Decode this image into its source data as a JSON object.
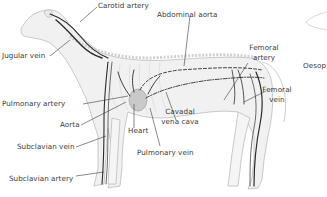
{
  "diagram": {
    "labels": {
      "carotid_artery": "Carotid artery",
      "abdominal_aorta": "Abdominal aorta",
      "jugular_vein": "Jugular vein",
      "femoral_artery_1": "Femoral",
      "femoral_artery_2": "artery",
      "femoral_vein_1": "Femoral",
      "femoral_vein_2": "vein",
      "pulmonary_artery": "Pulmonary artery",
      "aorta": "Aorta",
      "heart": "Heart",
      "cavadal_1": "Cavadal",
      "cavadal_2": "vena cava",
      "subclavian_vein": "Subclavian vein",
      "pulmonary_vein": "Pulmonary vein",
      "subclavian_artery": "Subclavian artery",
      "oesophagus_partial_1": "Oesop",
      "oesophagus_partial_2": "("
    },
    "colors": {
      "background": "#ffffff",
      "body_outline": "#bdbdbd",
      "body_fill": "#efefef",
      "vessel_dark": "#2b2b2b",
      "vessel_mid": "#5a5a5a",
      "heart_fill": "#c9c9c9",
      "label_text": "#3a3a3a",
      "leader_line": "#3a3a3a"
    }
  }
}
